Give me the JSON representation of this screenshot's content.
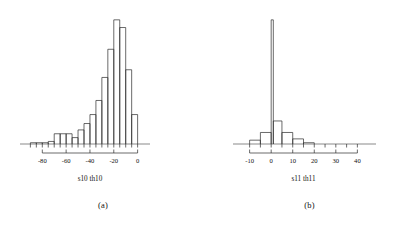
{
  "figure": {
    "background": "#ffffff",
    "ink_color": "#2b2b2b"
  },
  "panels": [
    {
      "id": "a",
      "caption": "(a)",
      "chart_ref": 0
    },
    {
      "id": "b",
      "caption": "(b)",
      "chart_ref": 1
    }
  ],
  "chart_data": [
    {
      "type": "bar",
      "subtype": "histogram",
      "title": "",
      "xlabel": "s10 th10",
      "ylabel": "",
      "xlim": [
        -92,
        2
      ],
      "ylim": [
        0,
        100
      ],
      "grid": false,
      "legend": false,
      "axis_ticks": [
        -80,
        -60,
        -40,
        -20,
        0
      ],
      "tick_labels": [
        "-80",
        "-60",
        "-40",
        "-20",
        "0"
      ],
      "minor_ticks": [
        -90,
        -85,
        -80,
        -75,
        -70,
        -65,
        -60,
        -55,
        -50,
        -45,
        -40,
        -35,
        -30,
        -25,
        -20,
        -15,
        -10,
        -5,
        0
      ],
      "bin_width": 5,
      "bin_edges": [
        -90,
        -85,
        -80,
        -75,
        -70,
        -65,
        -60,
        -55,
        -50,
        -45,
        -40,
        -35,
        -30,
        -25,
        -20,
        -15,
        -10,
        -5,
        0
      ],
      "values": [
        1,
        1,
        1,
        2,
        8,
        8,
        8,
        5,
        11,
        16,
        23,
        34,
        52,
        74,
        97,
        91,
        58,
        23
      ],
      "categories": [
        "-90..-85",
        "-85..-80",
        "-80..-75",
        "-75..-70",
        "-70..-65",
        "-65..-60",
        "-60..-55",
        "-55..-50",
        "-50..-45",
        "-45..-40",
        "-40..-35",
        "-35..-30",
        "-30..-25",
        "-25..-20",
        "-20..-15",
        "-15..-10",
        "-10..-5",
        "-5..0"
      ]
    },
    {
      "type": "bar",
      "subtype": "histogram",
      "title": "",
      "xlabel": "s11 th11",
      "ylabel": "",
      "xlim": [
        -14,
        44
      ],
      "ylim": [
        0,
        100
      ],
      "grid": false,
      "legend": false,
      "axis_ticks": [
        -10,
        0,
        10,
        20,
        30,
        40
      ],
      "tick_labels": [
        "-10",
        "0",
        "10",
        "20",
        "30",
        "40"
      ],
      "minor_ticks": [
        -10,
        -5,
        0,
        5,
        10,
        15,
        20,
        25,
        30,
        35,
        40
      ],
      "bin_width": 5,
      "bin_edges": [
        -10,
        -5,
        0,
        1,
        5,
        10,
        15,
        20
      ],
      "values": [
        3,
        9,
        97,
        18,
        9,
        4,
        1
      ],
      "categories": [
        "-10..-5",
        "-5..0",
        "0..1 (spike)",
        "1..5",
        "5..10",
        "10..15",
        "15..20"
      ]
    }
  ]
}
